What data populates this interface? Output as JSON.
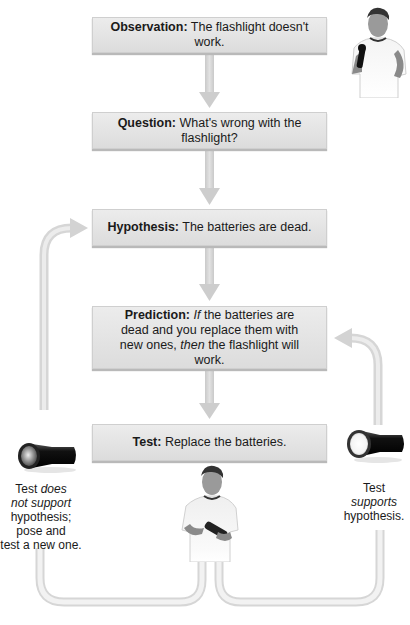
{
  "diagram": {
    "type": "flowchart",
    "steps": [
      {
        "term": "Observation:",
        "text": " The flashlight doesn't work."
      },
      {
        "term": "Question:",
        "text": " What's wrong with the flashlight?"
      },
      {
        "term": "Hypothesis:",
        "text": " The batteries are dead."
      },
      {
        "term": "Prediction:",
        "text_if": "If",
        "text_mid": " the batteries are dead and you replace them with new ones, ",
        "text_then": "then",
        "text_end": " the flashlight will work."
      },
      {
        "term": "Test:",
        "text": " Replace the batteries."
      }
    ],
    "left_outcome": {
      "line1_plain": "Test ",
      "line1_italic": "does",
      "line2_italic": "not support",
      "line3": "hypothesis;",
      "line4": "pose and",
      "line5": "test a new one.",
      "icon": "flashlight-off-icon"
    },
    "right_outcome": {
      "line1": "Test",
      "line2_italic": "supports",
      "line3": "hypothesis.",
      "icon": "flashlight-on-icon"
    },
    "colors": {
      "box_fill": "#e3e3e3",
      "arrow": "#d0d0d0",
      "text": "#1a1a1a"
    }
  }
}
